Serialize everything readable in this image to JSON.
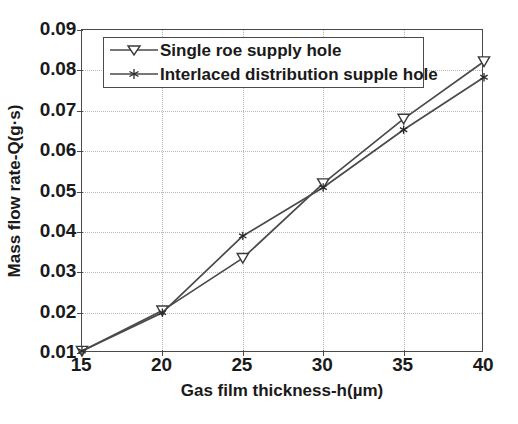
{
  "chart_data": {
    "type": "line",
    "title": "",
    "xlabel": "Gas film thickness-h(µm)",
    "ylabel": "Mass flow rate-Q(g·s)",
    "x": [
      15,
      20,
      25,
      30,
      35,
      40
    ],
    "xlim": [
      15,
      40
    ],
    "ylim": [
      0.01,
      0.09
    ],
    "xticks": [
      15,
      20,
      25,
      30,
      35,
      40
    ],
    "yticks": [
      0.01,
      0.02,
      0.03,
      0.04,
      0.05,
      0.06,
      0.07,
      0.08,
      0.09
    ],
    "xtick_labels": [
      "15",
      "20",
      "25",
      "30",
      "35",
      "40"
    ],
    "ytick_labels": [
      "0.01",
      "0.02",
      "0.03",
      "0.04",
      "0.05",
      "0.06",
      "0.07",
      "0.08",
      "0.09"
    ],
    "grid": true,
    "grid_style": "dotted",
    "legend_position": "upper left",
    "series": [
      {
        "name": "Single roe supply hole",
        "marker": "triangle-down-open",
        "color": "#4a4a4a",
        "values": [
          0.0105,
          0.0205,
          0.0335,
          0.052,
          0.068,
          0.0822
        ]
      },
      {
        "name": "Interlaced distribution supple hole",
        "marker": "star",
        "color": "#4a4a4a",
        "values": [
          0.0105,
          0.02,
          0.039,
          0.051,
          0.0653,
          0.0783
        ]
      }
    ]
  },
  "legend": {
    "items": [
      {
        "label": "Single roe supply hole"
      },
      {
        "label": "Interlaced distribution supple hole"
      }
    ]
  },
  "colors": {
    "axis": "#4a4a4a",
    "grid": "#b9b9b9",
    "text": "#1a1a1a",
    "background": "#ffffff"
  }
}
